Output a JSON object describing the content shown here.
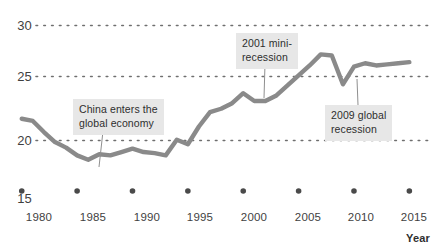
{
  "chart_data": {
    "type": "line",
    "title": "",
    "xlabel": "Year",
    "ylabel": "",
    "xlim": [
      1979,
      2015.5
    ],
    "ylim": [
      15,
      30.6
    ],
    "grid": true,
    "grid_style": "dotted-horizontal",
    "legend": "none",
    "line_color": "#8a8a8a",
    "x_ticks": [
      "1980",
      "1985",
      "1990",
      "1995",
      "2000",
      "2005",
      "2010",
      "2015"
    ],
    "x_tick_values": [
      1980,
      1985,
      1990,
      1995,
      2000,
      2005,
      2010,
      2015
    ],
    "y_ticks": [
      "15",
      "20",
      "25",
      "30"
    ],
    "y_tick_values": [
      15,
      20,
      25,
      30
    ],
    "x": [
      1980,
      1981,
      1982,
      1983,
      1984,
      1985,
      1986,
      1987,
      1988,
      1989,
      1990,
      1991,
      1992,
      1993,
      1994,
      1995,
      1996,
      1997,
      1998,
      1999,
      2000,
      2001,
      2002,
      2003,
      2004,
      2005,
      2006,
      2007,
      2008,
      2009,
      2010,
      2011,
      2012,
      2013,
      2014,
      2015
    ],
    "y": [
      21.6,
      21.4,
      20.4,
      19.5,
      19.0,
      18.3,
      17.9,
      18.4,
      18.3,
      18.6,
      18.9,
      18.6,
      18.5,
      18.3,
      19.7,
      19.3,
      20.9,
      22.2,
      22.5,
      23.0,
      23.9,
      23.2,
      23.2,
      23.7,
      24.6,
      25.5,
      26.4,
      27.4,
      27.3,
      24.7,
      26.3,
      26.6,
      26.4,
      26.5,
      26.6,
      26.7
    ],
    "series": [
      {
        "name": "value",
        "values": [
          21.6,
          21.4,
          20.4,
          19.5,
          19.0,
          18.3,
          17.9,
          18.4,
          18.3,
          18.6,
          18.9,
          18.6,
          18.5,
          18.3,
          19.7,
          19.3,
          20.9,
          22.2,
          22.5,
          23.0,
          23.9,
          23.2,
          23.2,
          23.7,
          24.6,
          25.5,
          26.4,
          27.4,
          27.3,
          24.7,
          26.3,
          26.6,
          26.4,
          26.5,
          26.6,
          26.7
        ]
      }
    ],
    "annotations": [
      {
        "id": "china-entry",
        "text": "China enters the\nglobal economy",
        "pointer_year": 1987,
        "pointer_value": 18.4,
        "box_x": 73,
        "box_y": 99,
        "leader_from_x": 103,
        "leader_from_y": 131,
        "leader_to_x": 99,
        "leader_to_y": 167
      },
      {
        "id": "mini-recession-2001",
        "text": "2001 mini-\nrecession",
        "pointer_year": 2001,
        "pointer_value": 23.2,
        "box_x": 236,
        "box_y": 33,
        "leader_from_x": 265,
        "leader_from_y": 64,
        "leader_to_x": 264,
        "leader_to_y": 98
      },
      {
        "id": "global-recession-2009",
        "text": "2009 global\nrecession",
        "pointer_year": 2009,
        "pointer_value": 24.7,
        "box_x": 325,
        "box_y": 105,
        "leader_from_x": 358,
        "leader_from_y": 105,
        "leader_to_x": 357,
        "leader_to_y": 79
      }
    ]
  },
  "axes": {
    "x_axis_title": "Year",
    "y_tick_labels": [
      {
        "label": "30",
        "top": 18
      },
      {
        "label": "25",
        "top": 69
      },
      {
        "label": "20",
        "top": 133
      },
      {
        "label": "15",
        "top": 191
      }
    ],
    "x_tick_labels": [
      {
        "label": "1980",
        "left": 16
      },
      {
        "label": "1985",
        "left": 70
      },
      {
        "label": "1990",
        "left": 124
      },
      {
        "label": "1995",
        "left": 177
      },
      {
        "label": "2000",
        "left": 231
      },
      {
        "label": "2005",
        "left": 285
      },
      {
        "label": "2010",
        "left": 338
      },
      {
        "label": "2015",
        "left": 391
      }
    ]
  }
}
